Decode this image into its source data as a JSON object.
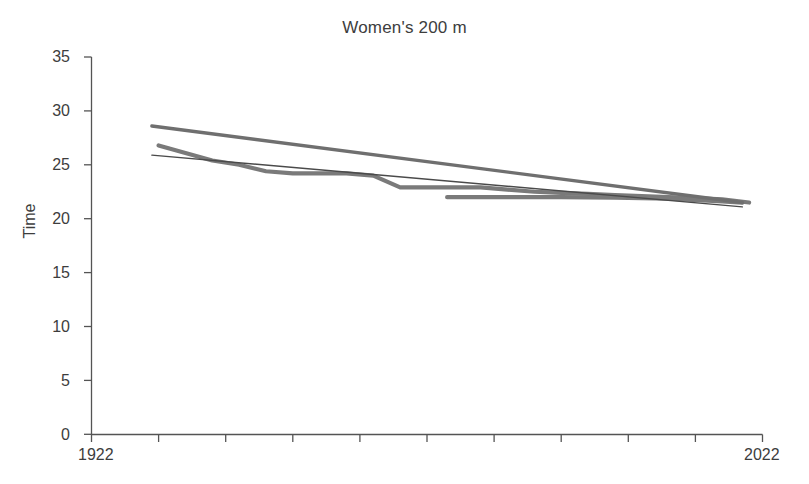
{
  "chart_data": {
    "type": "line",
    "title": "Women's 200 m",
    "xlabel": "",
    "ylabel": "Time",
    "xlim": [
      1922,
      2022
    ],
    "ylim": [
      0,
      35
    ],
    "grid": false,
    "legend": null,
    "y_ticks": [
      0,
      5,
      10,
      15,
      20,
      25,
      30,
      35
    ],
    "y_tick_labels": [
      "0",
      "5",
      "10",
      "15",
      "20",
      "25",
      "30",
      "35"
    ],
    "x_tick_labels_shown": [
      "1922",
      "2022"
    ],
    "x_axis_start_label": "1922",
    "x_axis_end_label": "2022",
    "x_minor_ticks": [
      1932,
      1942,
      1952,
      1962,
      1972,
      1982,
      1992,
      2002,
      2012,
      2022
    ],
    "colors": {
      "series_record": "#7a7a7a",
      "series_trend_thick": "#6f6f6f",
      "series_trend_thin": "#4a4a4a",
      "series_recent": "#7a7a7a",
      "axis": "#545454",
      "text": "#3d3d3d",
      "background": "#ffffff"
    },
    "series": [
      {
        "name": "World record progression",
        "style": "thick-step",
        "color": "#7a7a7a",
        "width": 4.2,
        "x": [
          1932,
          1936,
          1940,
          1944,
          1948,
          1952,
          1956,
          1960,
          1964,
          1968,
          1972,
          1976,
          1980,
          1984,
          1988,
          1992,
          1996,
          2000,
          2004,
          2008,
          2012,
          2016,
          2020
        ],
        "y": [
          26.8,
          26.1,
          25.4,
          25.0,
          24.4,
          24.2,
          24.2,
          24.2,
          24.0,
          22.9,
          22.9,
          22.9,
          22.9,
          22.7,
          22.5,
          22.4,
          22.3,
          22.2,
          22.1,
          22.0,
          21.9,
          21.8,
          21.5
        ]
      },
      {
        "name": "Linear trend (steep)",
        "style": "thick-straight",
        "color": "#6f6f6f",
        "width": 3.4,
        "x": [
          1931,
          2019
        ],
        "y": [
          28.6,
          21.5
        ]
      },
      {
        "name": "Linear trend (shallow)",
        "style": "thin-straight",
        "color": "#4a4a4a",
        "width": 1.4,
        "x": [
          1931,
          2019
        ],
        "y": [
          25.9,
          21.1
        ]
      },
      {
        "name": "Recent segment",
        "style": "thick-flat",
        "color": "#7a7a7a",
        "width": 4.2,
        "x": [
          1975,
          1984,
          1992,
          2000,
          2008,
          2016,
          2019
        ],
        "y": [
          22.0,
          22.0,
          22.0,
          21.95,
          21.85,
          21.6,
          21.5
        ]
      }
    ]
  }
}
